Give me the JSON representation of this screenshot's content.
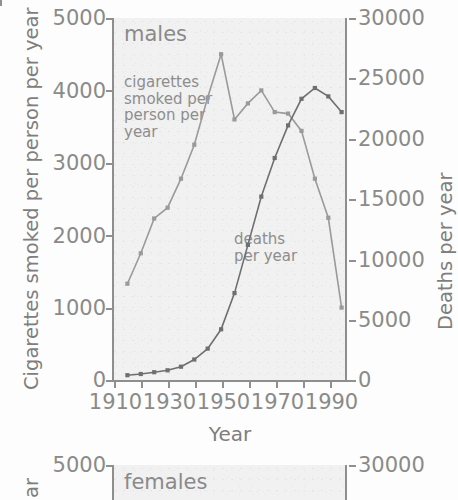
{
  "figure": {
    "axis_color": "#8e8e8e",
    "text_color": "#8a8a8a",
    "plot_bg": "#f1f1f1",
    "cigarettes_color": "#9a9a9a",
    "deaths_color": "#6f6f6f"
  },
  "panels": [
    {
      "name": "males",
      "title": "males",
      "left_axis_label": "Cigarettes smoked per person per year",
      "right_axis_label": "Deaths per year",
      "xlabel": "Year",
      "left_ticks": [
        "5000",
        "4000",
        "3000",
        "2000",
        "1000",
        "0"
      ],
      "right_ticks": [
        "30000",
        "25000",
        "20000",
        "15000",
        "10000",
        "5000",
        "0"
      ],
      "x_ticks": [
        "1910",
        "1930",
        "1950",
        "1970",
        "1990"
      ],
      "annotations": {
        "cigarettes": "cigarettes\nsmoked per\nperson per\nyear",
        "deaths": "deaths\nper year"
      }
    },
    {
      "name": "females",
      "title": "females",
      "left_axis_label": "ar",
      "left_ticks": [
        "5000"
      ],
      "right_ticks": [
        "30000"
      ]
    }
  ],
  "chart_data": [
    {
      "type": "line",
      "title": "males",
      "xlabel": "Year",
      "ylabel": "Cigarettes smoked per person per year",
      "y2label": "Deaths per year",
      "xlim": [
        1905,
        1992
      ],
      "ylim": [
        0,
        5000
      ],
      "y2lim": [
        0,
        30000
      ],
      "ytick_values": [
        0,
        1000,
        2000,
        3000,
        4000,
        5000
      ],
      "y2tick_values": [
        0,
        5000,
        10000,
        15000,
        20000,
        25000,
        30000
      ],
      "xtick_values": [
        1910,
        1930,
        1950,
        1970,
        1990
      ],
      "grid": false,
      "legend": "in-plot annotations",
      "series": [
        {
          "name": "cigarettes smoked per person per year",
          "axis": "left",
          "color": "#9a9a9a",
          "x": [
            1910,
            1915,
            1920,
            1925,
            1930,
            1935,
            1940,
            1945,
            1950,
            1955,
            1960,
            1965,
            1970,
            1975,
            1980,
            1985,
            1990
          ],
          "values": [
            1330,
            1750,
            2230,
            2380,
            2780,
            3250,
            3900,
            4500,
            3600,
            3820,
            4000,
            3700,
            3680,
            3440,
            2780,
            2240,
            1000
          ]
        },
        {
          "name": "deaths per year",
          "axis": "right",
          "color": "#6f6f6f",
          "x": [
            1910,
            1915,
            1920,
            1925,
            1930,
            1935,
            1940,
            1945,
            1950,
            1955,
            1960,
            1965,
            1970,
            1975,
            1980,
            1985,
            1990
          ],
          "values": [
            400,
            500,
            650,
            800,
            1100,
            1700,
            2600,
            4200,
            7200,
            11200,
            15200,
            18400,
            21100,
            23300,
            24200,
            23500,
            22200
          ]
        }
      ]
    },
    {
      "type": "line",
      "title": "females",
      "ylim": [
        0,
        5000
      ],
      "y2lim": [
        0,
        30000
      ],
      "ytick_values": [
        5000
      ],
      "y2tick_values": [
        30000
      ],
      "series": []
    }
  ]
}
